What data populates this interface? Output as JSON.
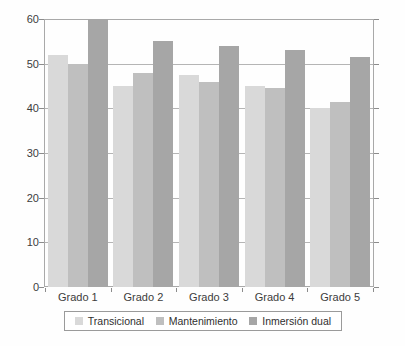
{
  "chart_data": {
    "type": "bar",
    "title": "",
    "xlabel": "",
    "ylabel": "",
    "categories": [
      "Grado 1",
      "Grado 2",
      "Grado 3",
      "Grado 4",
      "Grado 5"
    ],
    "series": [
      {
        "name": "Transicional",
        "color": "#d9d9d9",
        "values": [
          52,
          45,
          47.5,
          45,
          40
        ]
      },
      {
        "name": "Mantenimiento",
        "color": "#bfbfbf",
        "values": [
          50,
          48,
          46,
          44.5,
          41.5
        ]
      },
      {
        "name": "Inmersión dual",
        "color": "#a6a6a6",
        "values": [
          60,
          55,
          54,
          53,
          51.5
        ]
      }
    ],
    "ylim": [
      0,
      60
    ],
    "yticks": [
      0,
      10,
      20,
      30,
      40,
      50,
      60
    ],
    "ytick_labels": [
      "0",
      "10",
      "20",
      "30",
      "40",
      "50",
      "60"
    ],
    "grid": true,
    "legend_position": "bottom"
  },
  "legend": {
    "items": [
      {
        "label": "Transicional"
      },
      {
        "label": "Mantenimiento"
      },
      {
        "label": "Inmersión dual"
      }
    ]
  }
}
